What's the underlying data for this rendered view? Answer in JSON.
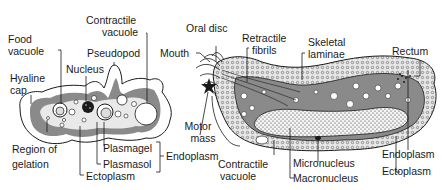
{
  "diagram": {
    "amoeba": {
      "labels": {
        "food_vacuole_1": "Food",
        "food_vacuole_2": "vacuole",
        "contractile_vacuole_1": "Contractile",
        "contractile_vacuole_2": "vacuole",
        "pseudopod": "Pseudopod",
        "nucleus": "Nucleus",
        "hyaline_cap_1": "Hyaline",
        "hyaline_cap_2": "cap",
        "region_of_gelation_1": "Region of",
        "region_of_gelation_2": "gelation",
        "plasmagel": "Plasmagel",
        "plasmasol": "Plasmasol",
        "endoplasm": "Endoplasm",
        "ectoplasm": "Ectoplasm"
      }
    },
    "ciliate": {
      "labels": {
        "oral_disc": "Oral disc",
        "mouth": "Mouth",
        "retractile_fibrils_1": "Retractile",
        "retractile_fibrils_2": "fibrils",
        "skeletal_laminae_1": "Skeletal",
        "skeletal_laminae_2": "laminae",
        "rectum": "Rectum",
        "motor_mass_1": "Motor",
        "motor_mass_2": "mass",
        "contractile_vacuole_1": "Contractile",
        "contractile_vacuole_2": "vacuole",
        "micronucleus": "Micronucleus",
        "macronucleus": "Macronucleus",
        "endoplasm": "Endoplasm",
        "ectoplasm": "Ectoplasm"
      }
    },
    "colors": {
      "ink": "#1a1a1a",
      "endoplasm_gray": "#8a8a8a",
      "light_gray": "#cfcfcf",
      "background": "#ffffff"
    }
  }
}
